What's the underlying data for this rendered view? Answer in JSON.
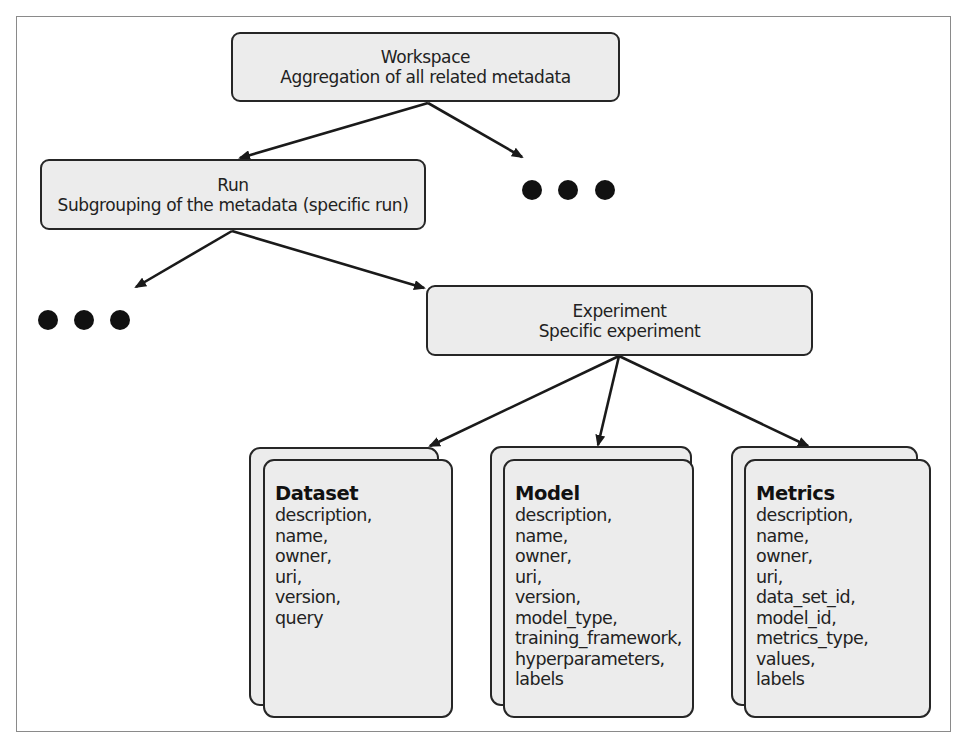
{
  "diagram": {
    "workspace": {
      "title": "Workspace",
      "subtitle": "Aggregation of all related metadata"
    },
    "run": {
      "title": "Run",
      "subtitle": "Subgrouping of the metadata (specific run)"
    },
    "experiment": {
      "title": "Experiment",
      "subtitle": "Specific experiment"
    },
    "ellipsis_symbol": "●●●",
    "cards": [
      {
        "title": "Dataset",
        "fields": [
          "description,",
          "name,",
          "owner,",
          "uri,",
          "version,",
          "query"
        ]
      },
      {
        "title": "Model",
        "fields": [
          "description,",
          "name,",
          "owner,",
          "uri,",
          "version,",
          "model_type,",
          "training_framework,",
          "hyperparameters,",
          "labels"
        ]
      },
      {
        "title": "Metrics",
        "fields": [
          "description,",
          "name,",
          "owner,",
          "uri,",
          "data_set_id,",
          "model_id,",
          "metrics_type,",
          "values,",
          "labels"
        ]
      }
    ],
    "colors": {
      "box_fill": "#ececec",
      "box_border": "#262626",
      "arrow": "#1a1a1a",
      "frame": "#8a8a8a"
    }
  }
}
